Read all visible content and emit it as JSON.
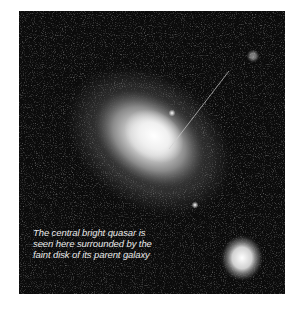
{
  "figure": {
    "caption_lines": [
      "The central bright quasar is",
      "seen here surrounded by the",
      "faint disk of its parent galaxy"
    ]
  }
}
